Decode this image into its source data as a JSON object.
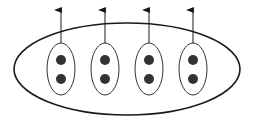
{
  "diagram": {
    "colors": {
      "background": "#ffffff",
      "stroke": "#1a1a1a",
      "dot": "#333333"
    },
    "outer_ellipse": {
      "cx": 127,
      "cy": 69,
      "rx": 113,
      "ry": 46
    },
    "groups": [
      {
        "cx": 61,
        "cy": 69,
        "rx": 14,
        "ry": 26,
        "dots": [
          60,
          79
        ],
        "arrow_top": 10
      },
      {
        "cx": 105,
        "cy": 69,
        "rx": 14,
        "ry": 26,
        "dots": [
          60,
          79
        ],
        "arrow_top": 10
      },
      {
        "cx": 149,
        "cy": 69,
        "rx": 14,
        "ry": 26,
        "dots": [
          60,
          79
        ],
        "arrow_top": 10
      },
      {
        "cx": 193,
        "cy": 69,
        "rx": 14,
        "ry": 26,
        "dots": [
          60,
          79
        ],
        "arrow_top": 10
      }
    ]
  }
}
